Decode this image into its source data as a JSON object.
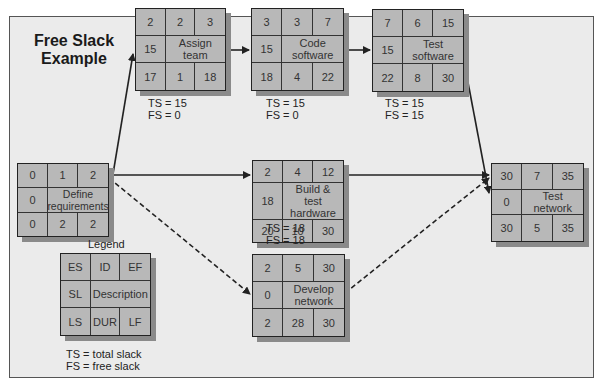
{
  "title": {
    "line1": "Free Slack",
    "line2": "Example"
  },
  "nodes": {
    "define": {
      "es": "0",
      "id": "1",
      "ef": "2",
      "sl": "0",
      "desc": "Define requirements",
      "ls": "0",
      "dur": "2",
      "lf": "2"
    },
    "assign": {
      "es": "2",
      "id": "2",
      "ef": "3",
      "sl": "15",
      "desc": "Assign team",
      "ls": "17",
      "dur": "1",
      "lf": "18"
    },
    "code": {
      "es": "3",
      "id": "3",
      "ef": "7",
      "sl": "15",
      "desc": "Code software",
      "ls": "18",
      "dur": "4",
      "lf": "22"
    },
    "testsw": {
      "es": "7",
      "id": "6",
      "ef": "15",
      "sl": "15",
      "desc": "Test software",
      "ls": "22",
      "dur": "8",
      "lf": "30"
    },
    "build": {
      "es": "2",
      "id": "4",
      "ef": "12",
      "sl": "18",
      "desc": "Build & test hardware",
      "ls": "20",
      "dur": "10",
      "lf": "30"
    },
    "develop": {
      "es": "2",
      "id": "5",
      "ef": "30",
      "sl": "0",
      "desc": "Develop network",
      "ls": "2",
      "dur": "28",
      "lf": "30"
    },
    "testnet": {
      "es": "30",
      "id": "7",
      "ef": "35",
      "sl": "0",
      "desc": "Test network",
      "ls": "30",
      "dur": "5",
      "lf": "35"
    }
  },
  "slack": {
    "assign": {
      "ts": "TS = 15",
      "fs": "FS = 0"
    },
    "code": {
      "ts": "TS = 15",
      "fs": "FS = 0"
    },
    "testsw": {
      "ts": "TS = 15",
      "fs": "FS = 15"
    },
    "build": {
      "ts": "TS = 18",
      "fs": "FS = 18"
    }
  },
  "legend": {
    "title": "Legend",
    "cells": {
      "es": "ES",
      "id": "ID",
      "ef": "EF",
      "sl": "SL",
      "desc": "Description",
      "ls": "LS",
      "dur": "DUR",
      "lf": "LF"
    },
    "ts_note": "TS = total slack",
    "fs_note": "FS = free slack"
  },
  "colors": {
    "background": "#ebebeb",
    "cell": "#b8b8b8",
    "shadow": "#8a8a8a",
    "line": "#222222"
  }
}
